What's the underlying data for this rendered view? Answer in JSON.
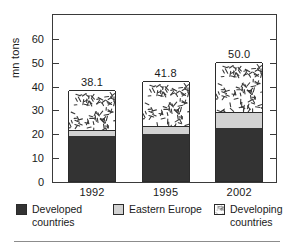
{
  "chart_data": {
    "type": "bar",
    "subtype": "stacked-bar",
    "title": "",
    "xlabel": "",
    "ylabel": "mn tons",
    "categories": [
      "1992",
      "1995",
      "2002"
    ],
    "ylim": [
      0,
      70
    ],
    "yticks": [
      0,
      10,
      20,
      30,
      40,
      50,
      60
    ],
    "ytick_labels": [
      "0",
      "10",
      "20",
      "30",
      "40",
      "50",
      "60"
    ],
    "grid": false,
    "legend_position": "bottom",
    "series": [
      {
        "name": "Developed countries",
        "fill": "solid-dark",
        "color": "#333333",
        "values": [
          18.7,
          19.5,
          22.3
        ]
      },
      {
        "name": "Eastern Europe",
        "fill": "solid-light-gray",
        "color": "#d2d2d2",
        "values": [
          2.8,
          3.6,
          6.5
        ]
      },
      {
        "name": "Developing countries",
        "fill": "hatched-speckle",
        "color": "#ffffff",
        "values": [
          16.6,
          18.7,
          21.2
        ]
      }
    ],
    "totals": [
      38.1,
      41.8,
      50.0
    ],
    "total_labels": [
      "38.1",
      "41.8",
      "50.0"
    ]
  },
  "axis": {
    "y_title": "mn tons",
    "y_tick_labels": [
      "0",
      "10",
      "20",
      "30",
      "40",
      "50",
      "60"
    ],
    "x_tick_labels": [
      "1992",
      "1995",
      "2002"
    ]
  },
  "legend": {
    "items": [
      {
        "label": "Developed\ncountries",
        "swatch": "swatch-developed-countries"
      },
      {
        "label": "Eastern Europe",
        "swatch": "swatch-eastern-europe"
      },
      {
        "label": "Developing\ncountries",
        "swatch": "swatch-developing-countries"
      }
    ]
  },
  "value_labels": [
    "38.1",
    "41.8",
    "50.0"
  ],
  "colors": {
    "developed": "#333333",
    "eastern_europe": "#d2d2d2",
    "developing": "#ffffff",
    "frame": "#3a3a3a",
    "text": "#1a1a1a",
    "rule": "#8c8c8c"
  }
}
